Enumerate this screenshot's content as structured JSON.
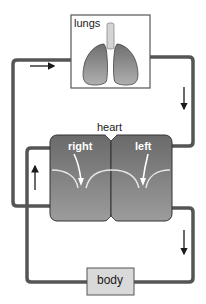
{
  "diagram": {
    "type": "circulatory-system",
    "title": "",
    "nodes": {
      "lungs": {
        "label": "lungs"
      },
      "heart": {
        "label": "heart",
        "chambers": [
          {
            "id": "right",
            "label": "right"
          },
          {
            "id": "left",
            "label": "left"
          }
        ]
      },
      "body": {
        "label": "body"
      }
    },
    "flows": [
      {
        "from": "heart-right",
        "to": "lungs",
        "direction": "right",
        "arrow_side": "left-top"
      },
      {
        "from": "lungs",
        "to": "heart-left",
        "direction": "down",
        "arrow_side": "right-top"
      },
      {
        "from": "heart-left",
        "to": "body",
        "direction": "down",
        "arrow_side": "right-bottom"
      },
      {
        "from": "body",
        "to": "heart-right",
        "direction": "up",
        "arrow_side": "left-bottom"
      }
    ],
    "colors": {
      "pipe": "#555555",
      "heart_fill_top": "#6e6e6e",
      "heart_fill_bottom": "#9a9a9a",
      "lung_fill": "#8c8c8c",
      "box_border": "#555555",
      "body_box_fill": "#d9d9d9",
      "valve": "#e8e8e8"
    }
  }
}
